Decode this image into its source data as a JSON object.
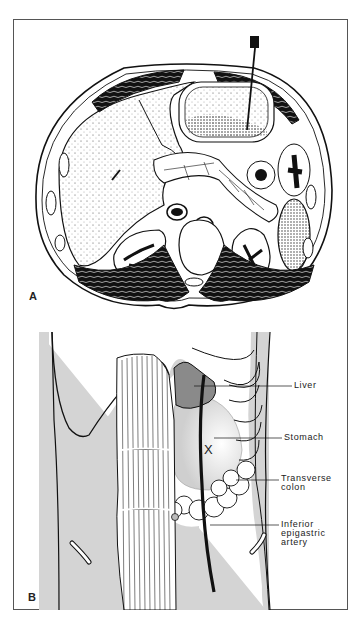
{
  "figure": {
    "panel_a": {
      "letter": "A",
      "description": "Axial cross-section of upper abdomen with needle entering stomach"
    },
    "panel_b": {
      "letter": "B",
      "marker": "X",
      "labels": [
        {
          "id": "liver",
          "text": "Liver"
        },
        {
          "id": "stomach",
          "text": "Stomach"
        },
        {
          "id": "transverse-colon",
          "text": "Transverse\ncolon"
        },
        {
          "id": "inferior-epigastric-artery",
          "text": "Inferior\nepigastric\nartery"
        }
      ]
    },
    "colors": {
      "ink": "#111111",
      "skin_gray": "#d4d4d4",
      "liver_gray": "#8a8a8a",
      "border": "#555555"
    }
  }
}
